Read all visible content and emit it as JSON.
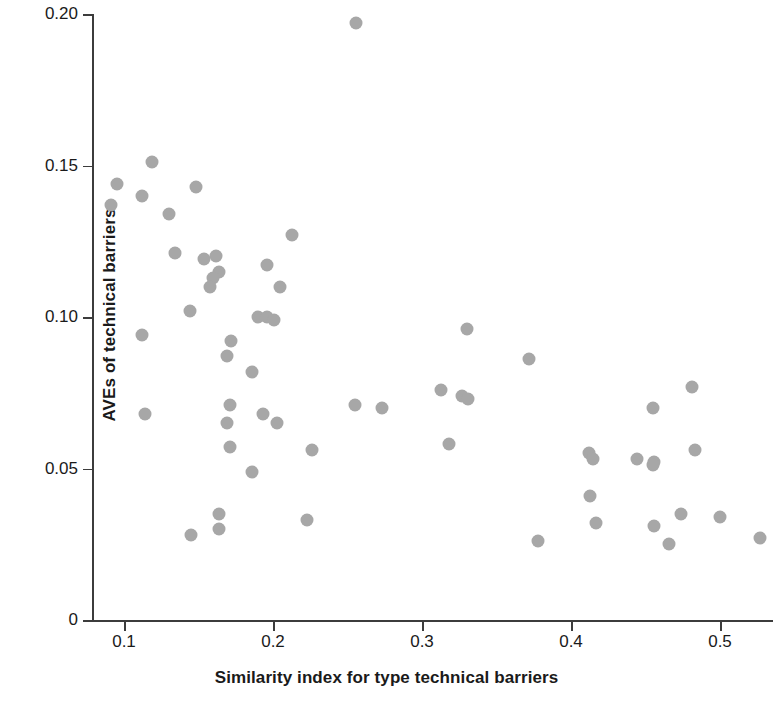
{
  "chart_data": {
    "type": "scatter",
    "title": "",
    "xlabel": "Similarity index for type technical barriers",
    "ylabel": "AVEs of technical barriers",
    "xlim": [
      0.082,
      0.545
    ],
    "ylim": [
      0.0,
      0.2
    ],
    "xticks": [
      0.1,
      0.2,
      0.3,
      0.4,
      0.5
    ],
    "xtick_labels": [
      "0.1",
      "0.2",
      "0.3",
      "0.4",
      "0.5"
    ],
    "yticks": [
      0,
      0.05,
      0.1,
      0.15,
      0.2
    ],
    "ytick_labels": [
      "0",
      "0.05",
      "0.10",
      "0.15",
      "0.20"
    ],
    "grid": false,
    "legend": "none",
    "marker_color": "#a7a7a7",
    "marker_size_px": 13,
    "axis_color": "#3c3c3c",
    "text_color": "#1a1a1a",
    "points": [
      {
        "x": 0.256,
        "y": 0.197
      },
      {
        "x": 0.119,
        "y": 0.151
      },
      {
        "x": 0.148,
        "y": 0.143
      },
      {
        "x": 0.095,
        "y": 0.144
      },
      {
        "x": 0.112,
        "y": 0.14
      },
      {
        "x": 0.091,
        "y": 0.137
      },
      {
        "x": 0.13,
        "y": 0.134
      },
      {
        "x": 0.213,
        "y": 0.127
      },
      {
        "x": 0.134,
        "y": 0.121
      },
      {
        "x": 0.162,
        "y": 0.12
      },
      {
        "x": 0.154,
        "y": 0.119
      },
      {
        "x": 0.196,
        "y": 0.117
      },
      {
        "x": 0.164,
        "y": 0.115
      },
      {
        "x": 0.16,
        "y": 0.113
      },
      {
        "x": 0.158,
        "y": 0.11
      },
      {
        "x": 0.205,
        "y": 0.11
      },
      {
        "x": 0.144,
        "y": 0.102
      },
      {
        "x": 0.19,
        "y": 0.1
      },
      {
        "x": 0.196,
        "y": 0.1
      },
      {
        "x": 0.201,
        "y": 0.099
      },
      {
        "x": 0.112,
        "y": 0.094
      },
      {
        "x": 0.33,
        "y": 0.096
      },
      {
        "x": 0.172,
        "y": 0.092
      },
      {
        "x": 0.169,
        "y": 0.087
      },
      {
        "x": 0.372,
        "y": 0.086
      },
      {
        "x": 0.186,
        "y": 0.082
      },
      {
        "x": 0.481,
        "y": 0.077
      },
      {
        "x": 0.313,
        "y": 0.076
      },
      {
        "x": 0.327,
        "y": 0.074
      },
      {
        "x": 0.331,
        "y": 0.073
      },
      {
        "x": 0.171,
        "y": 0.071
      },
      {
        "x": 0.255,
        "y": 0.071
      },
      {
        "x": 0.273,
        "y": 0.07
      },
      {
        "x": 0.455,
        "y": 0.07
      },
      {
        "x": 0.114,
        "y": 0.068
      },
      {
        "x": 0.169,
        "y": 0.065
      },
      {
        "x": 0.203,
        "y": 0.065
      },
      {
        "x": 0.193,
        "y": 0.068
      },
      {
        "x": 0.318,
        "y": 0.058
      },
      {
        "x": 0.171,
        "y": 0.057
      },
      {
        "x": 0.226,
        "y": 0.056
      },
      {
        "x": 0.483,
        "y": 0.056
      },
      {
        "x": 0.412,
        "y": 0.055
      },
      {
        "x": 0.415,
        "y": 0.053
      },
      {
        "x": 0.444,
        "y": 0.053
      },
      {
        "x": 0.456,
        "y": 0.052
      },
      {
        "x": 0.455,
        "y": 0.051
      },
      {
        "x": 0.186,
        "y": 0.049
      },
      {
        "x": 0.413,
        "y": 0.041
      },
      {
        "x": 0.164,
        "y": 0.035
      },
      {
        "x": 0.474,
        "y": 0.035
      },
      {
        "x": 0.5,
        "y": 0.034
      },
      {
        "x": 0.223,
        "y": 0.033
      },
      {
        "x": 0.164,
        "y": 0.03
      },
      {
        "x": 0.417,
        "y": 0.032
      },
      {
        "x": 0.456,
        "y": 0.031
      },
      {
        "x": 0.145,
        "y": 0.028
      },
      {
        "x": 0.378,
        "y": 0.026
      },
      {
        "x": 0.466,
        "y": 0.025
      },
      {
        "x": 0.527,
        "y": 0.027
      }
    ]
  },
  "axes": {
    "y_title": "AVEs of technical barriers",
    "x_title": "Similarity index for type technical barriers"
  }
}
